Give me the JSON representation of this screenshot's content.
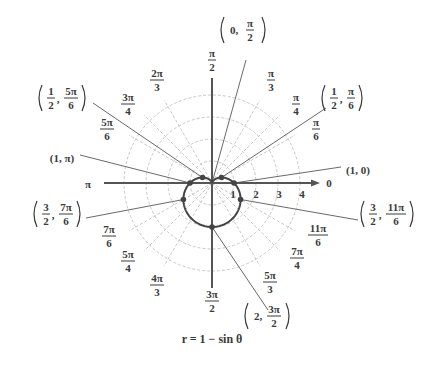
{
  "figure": {
    "caption": "r = 1 − sin θ",
    "equation": {
      "lhs": "r",
      "rhs": "1 − sin θ"
    }
  },
  "colors": {
    "grid": "#c8c8c8",
    "axis": "#555555",
    "curve": "#444444",
    "leader": "#6a6a6a",
    "text": "#3a3a3a"
  },
  "geometry": {
    "pole": [
      212,
      183
    ],
    "unit_px": 22,
    "grid_radii": [
      1,
      2,
      3,
      4
    ],
    "axis_left_x": 104,
    "axis_right_x": 320,
    "axis_top_y": 78,
    "axis_bottom_y": 288
  },
  "radial_ticks": [
    {
      "label": "1",
      "x": 233,
      "y": 198
    },
    {
      "label": "2",
      "x": 256,
      "y": 198
    },
    {
      "label": "3",
      "x": 279,
      "y": 198
    },
    {
      "label": "4",
      "x": 302,
      "y": 198
    }
  ],
  "axis_labels": [
    {
      "id": "zero",
      "text": "0",
      "x": 329,
      "y": 187
    },
    {
      "id": "pi",
      "text": "π",
      "x": 88,
      "y": 188
    }
  ],
  "angle_labels": [
    {
      "id": "pi-2",
      "num": "π",
      "den": "2",
      "x": 212,
      "y": 60
    },
    {
      "id": "pi-3",
      "num": "π",
      "den": "3",
      "x": 271,
      "y": 80
    },
    {
      "id": "pi-4",
      "num": "π",
      "den": "4",
      "x": 296,
      "y": 104
    },
    {
      "id": "pi-6",
      "num": "π",
      "den": "6",
      "x": 316,
      "y": 129
    },
    {
      "id": "2pi-3",
      "num": "2π",
      "den": "3",
      "x": 157,
      "y": 80
    },
    {
      "id": "3pi-4",
      "num": "3π",
      "den": "4",
      "x": 128,
      "y": 104
    },
    {
      "id": "5pi-6",
      "num": "5π",
      "den": "6",
      "x": 107,
      "y": 129
    },
    {
      "id": "7pi-6",
      "num": "7π",
      "den": "6",
      "x": 109,
      "y": 236
    },
    {
      "id": "5pi-4",
      "num": "5π",
      "den": "4",
      "x": 128,
      "y": 261
    },
    {
      "id": "4pi-3",
      "num": "4π",
      "den": "3",
      "x": 157,
      "y": 285
    },
    {
      "id": "3pi-2",
      "num": "3π",
      "den": "2",
      "x": 212,
      "y": 301
    },
    {
      "id": "5pi-3",
      "num": "5π",
      "den": "3",
      "x": 270,
      "y": 282
    },
    {
      "id": "7pi-4",
      "num": "7π",
      "den": "4",
      "x": 297,
      "y": 258
    },
    {
      "id": "11pi-6",
      "num": "11π",
      "den": "6",
      "x": 318,
      "y": 235
    }
  ],
  "grid_angles_deg": [
    30,
    45,
    60,
    120,
    135,
    150,
    210,
    225,
    240,
    300,
    315,
    330
  ],
  "points": [
    {
      "id": "p-0-pi2",
      "r": 0,
      "theta_deg": 90,
      "label_type": "frac",
      "left": "0,",
      "num": "π",
      "den": "2",
      "label_x": 242,
      "label_y": 30,
      "leader_to": [
        246,
        60
      ]
    },
    {
      "id": "p-half-pi6",
      "r": 0.5,
      "theta_deg": 30,
      "label_type": "frac2",
      "a_num": "1",
      "a_den": "2",
      "num": "π",
      "den": "6",
      "label_x": 343,
      "label_y": 98,
      "leader_to": [
        326,
        108
      ]
    },
    {
      "id": "p-half-5pi6",
      "r": 0.5,
      "theta_deg": 150,
      "label_type": "frac2",
      "a_num": "1",
      "a_den": "2",
      "num": "5π",
      "den": "6",
      "label_x": 60,
      "label_y": 98,
      "leader_to": [
        93,
        103
      ]
    },
    {
      "id": "p-1-0",
      "r": 1,
      "theta_deg": 0,
      "label_type": "plain",
      "text": "(1, 0)",
      "label_x": 358,
      "label_y": 170,
      "leader_to": [
        341,
        167
      ]
    },
    {
      "id": "p-1-pi",
      "r": 1,
      "theta_deg": 180,
      "label_type": "plain",
      "text": "(1, π)",
      "label_x": 62,
      "label_y": 158,
      "leader_to": [
        80,
        155
      ]
    },
    {
      "id": "p-3half-7pi6",
      "r": 1.5,
      "theta_deg": 210,
      "label_type": "frac2",
      "a_num": "3",
      "a_den": "2",
      "num": "7π",
      "den": "6",
      "label_x": 55,
      "label_y": 214,
      "leader_to": [
        86,
        218
      ]
    },
    {
      "id": "p-3half-11pi6",
      "r": 1.5,
      "theta_deg": 330,
      "label_type": "frac2",
      "a_num": "3",
      "a_den": "2",
      "num": "11π",
      "den": "6",
      "label_x": 382,
      "label_y": 214,
      "leader_to": [
        358,
        220
      ]
    },
    {
      "id": "p-2-3pi2",
      "r": 2,
      "theta_deg": 270,
      "label_type": "frac",
      "left": "2,",
      "num": "3π",
      "den": "2",
      "label_x": 266,
      "label_y": 316,
      "leader_to": [
        268,
        310
      ]
    }
  ]
}
